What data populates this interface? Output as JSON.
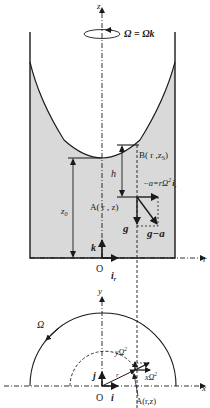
{
  "figure": {
    "top_panel": {
      "rotation_label": "Ω = Ωk",
      "axis_z": "z",
      "axis_r": "r",
      "origin": "O",
      "unit_k": "k",
      "unit_ir": "i",
      "unit_ir_sub": "r",
      "point_B": "B( r ,z",
      "point_B_sub": "S",
      "point_B_close": ")",
      "point_A": "A( r , z)",
      "height_h": "h",
      "height_z0": "z",
      "height_z0_sub": "0",
      "accel_label": "−a=rΩ",
      "accel_sup": "2",
      "accel_unit": "i",
      "accel_unit_sub": "r",
      "gravity": "g",
      "effective": "g−a"
    },
    "bottom_panel": {
      "axis_x": "x",
      "axis_y": "y",
      "origin": "O",
      "unit_i": "i",
      "unit_j": "j",
      "omega": "Ω",
      "radius": "r",
      "y_comp": "yΩ",
      "y_comp_sup": "2",
      "x_comp": "xΩ",
      "x_comp_sup": "2",
      "point_A": "A(r,z)"
    },
    "caption_partial": "图 ... 旋转容器中液体的压力"
  },
  "colors": {
    "fluid_fill": "#d9d9d9",
    "line": "#1a1a1a",
    "background": "#ffffff"
  }
}
